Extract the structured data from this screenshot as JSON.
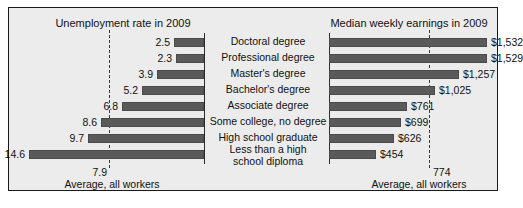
{
  "panel": {
    "left_chart": {
      "title": "Unemployment rate in 2009",
      "average_value": "7.9",
      "average_label": "Average, all workers"
    },
    "right_chart": {
      "title": "Median weekly earnings in 2009",
      "average_value": "774",
      "average_label": "Average, all workers"
    },
    "categories": [
      "Doctoral degree",
      "Professional degree",
      "Master's degree",
      "Bachelor's degree",
      "Associate degree",
      "Some college, no degree",
      "High school graduate",
      "Less than a high\nschool diploma"
    ],
    "unemployment_labels": [
      "2.5",
      "2.3",
      "3.9",
      "5.2",
      "6.8",
      "8.6",
      "9.7",
      "14.6"
    ],
    "earnings_labels": [
      "$1,532",
      "$1,529",
      "$1,257",
      "$1,025",
      "$761",
      "$699",
      "$626",
      "$454"
    ]
  },
  "colors": {
    "bar": "#5a5a5a",
    "panel_background": "#ececec",
    "frame": "#1a1a1a",
    "text": "#111111",
    "dashed_guide": "#3a3a3a"
  },
  "chart_data": [
    {
      "type": "bar",
      "title": "Unemployment rate in 2009",
      "orientation": "horizontal",
      "direction": "right-to-left",
      "xlabel": "",
      "ylabel": "",
      "categories": [
        "Doctoral degree",
        "Professional degree",
        "Master's degree",
        "Bachelor's degree",
        "Associate degree",
        "Some college, no degree",
        "High school graduate",
        "Less than a high school diploma"
      ],
      "values": [
        2.5,
        2.3,
        3.9,
        5.2,
        6.8,
        8.6,
        9.7,
        14.6
      ],
      "data_labels": [
        "2.5",
        "2.3",
        "3.9",
        "5.2",
        "6.8",
        "8.6",
        "9.7",
        "14.6"
      ],
      "xlim": [
        0,
        14.6
      ],
      "grid": false,
      "legend": null,
      "annotations": [
        {
          "type": "reference-line",
          "value": 7.9,
          "label": "7.9",
          "caption": "Average, all workers",
          "style": "dashed"
        }
      ]
    },
    {
      "type": "bar",
      "title": "Median weekly earnings in 2009",
      "orientation": "horizontal",
      "direction": "left-to-right",
      "xlabel": "",
      "ylabel": "",
      "categories": [
        "Doctoral degree",
        "Professional degree",
        "Master's degree",
        "Bachelor's degree",
        "Associate degree",
        "Some college, no degree",
        "High school graduate",
        "Less than a high school diploma"
      ],
      "values": [
        1532,
        1529,
        1257,
        1025,
        761,
        699,
        626,
        454
      ],
      "data_labels": [
        "$1,532",
        "$1,529",
        "$1,257",
        "$1,025",
        "$761",
        "$699",
        "$626",
        "$454"
      ],
      "xlim": [
        0,
        1532
      ],
      "grid": false,
      "legend": null,
      "annotations": [
        {
          "type": "reference-line",
          "value": 774,
          "label": "774",
          "caption": "Average, all workers",
          "style": "dashed"
        }
      ]
    }
  ]
}
